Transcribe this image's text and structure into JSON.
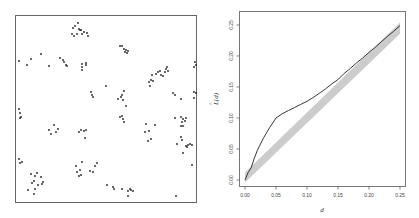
{
  "chart_data": [
    {
      "type": "scatter",
      "title": "",
      "description": "Point pattern in unit square (clustered)",
      "xlabel": "",
      "ylabel": "",
      "axes_visible": false,
      "frame_px": {
        "x0": 15,
        "y0": 15,
        "x1": 196,
        "y1": 202
      },
      "points_px": [
        [
          78,
          23
        ],
        [
          75,
          26
        ],
        [
          73,
          28
        ],
        [
          79,
          29
        ],
        [
          81,
          30
        ],
        [
          84,
          32
        ],
        [
          87,
          33
        ],
        [
          72,
          34
        ],
        [
          77,
          34
        ],
        [
          82,
          34
        ],
        [
          80,
          30
        ],
        [
          88,
          36
        ],
        [
          74,
          36
        ],
        [
          120,
          46
        ],
        [
          122,
          46
        ],
        [
          124,
          49
        ],
        [
          126,
          50
        ],
        [
          125,
          52
        ],
        [
          127,
          53
        ],
        [
          128,
          51
        ],
        [
          19,
          61
        ],
        [
          27,
          65
        ],
        [
          31,
          59
        ],
        [
          41,
          54
        ],
        [
          49,
          66
        ],
        [
          60,
          58
        ],
        [
          63,
          60
        ],
        [
          64,
          62
        ],
        [
          66,
          65
        ],
        [
          67,
          66
        ],
        [
          82,
          64
        ],
        [
          82,
          67
        ],
        [
          86,
          63
        ],
        [
          86,
          65
        ],
        [
          82,
          70
        ],
        [
          149,
          82
        ],
        [
          151,
          80
        ],
        [
          153,
          81
        ],
        [
          150,
          86
        ],
        [
          152,
          75
        ],
        [
          156,
          74
        ],
        [
          158,
          72
        ],
        [
          160,
          71
        ],
        [
          161,
          75
        ],
        [
          163,
          76
        ],
        [
          166,
          69
        ],
        [
          167,
          67
        ],
        [
          168,
          71
        ],
        [
          165,
          72
        ],
        [
          195,
          62
        ],
        [
          194,
          67
        ],
        [
          196,
          65
        ],
        [
          91,
          92
        ],
        [
          92,
          95
        ],
        [
          93,
          97
        ],
        [
          106,
          86
        ],
        [
          118,
          99
        ],
        [
          121,
          97
        ],
        [
          122,
          95
        ],
        [
          124,
          91
        ],
        [
          123,
          100
        ],
        [
          126,
          106
        ],
        [
          120,
          117
        ],
        [
          122,
          116
        ],
        [
          123,
          119
        ],
        [
          124,
          122
        ],
        [
          173,
          93
        ],
        [
          175,
          95
        ],
        [
          181,
          99
        ],
        [
          194,
          92
        ],
        [
          196,
          93
        ],
        [
          194,
          98
        ],
        [
          19,
          109
        ],
        [
          20,
          113
        ],
        [
          21,
          117
        ],
        [
          20,
          118
        ],
        [
          49,
          130
        ],
        [
          51,
          134
        ],
        [
          54,
          125
        ],
        [
          56,
          132
        ],
        [
          58,
          129
        ],
        [
          79,
          132
        ],
        [
          81,
          130
        ],
        [
          84,
          131
        ],
        [
          86,
          130
        ],
        [
          85,
          138
        ],
        [
          145,
          132
        ],
        [
          146,
          124
        ],
        [
          149,
          131
        ],
        [
          151,
          139
        ],
        [
          155,
          125
        ],
        [
          148,
          141
        ],
        [
          175,
          118
        ],
        [
          181,
          117
        ],
        [
          183,
          119
        ],
        [
          185,
          121
        ],
        [
          182,
          122
        ],
        [
          183,
          126
        ],
        [
          186,
          118
        ],
        [
          181,
          126
        ],
        [
          181,
          137
        ],
        [
          182,
          140
        ],
        [
          187,
          147
        ],
        [
          186,
          146
        ],
        [
          188,
          145
        ],
        [
          190,
          144
        ],
        [
          192,
          145
        ],
        [
          177,
          144
        ],
        [
          183,
          153
        ],
        [
          192,
          165
        ],
        [
          19,
          159
        ],
        [
          20,
          163
        ],
        [
          22,
          162
        ],
        [
          31,
          174
        ],
        [
          35,
          176
        ],
        [
          37,
          173
        ],
        [
          41,
          177
        ],
        [
          32,
          183
        ],
        [
          34,
          181
        ],
        [
          38,
          185
        ],
        [
          42,
          184
        ],
        [
          28,
          190
        ],
        [
          35,
          189
        ],
        [
          43,
          182
        ],
        [
          34,
          194
        ],
        [
          76,
          166
        ],
        [
          77,
          172
        ],
        [
          80,
          170
        ],
        [
          82,
          162
        ],
        [
          79,
          176
        ],
        [
          90,
          171
        ],
        [
          93,
          172
        ],
        [
          95,
          166
        ],
        [
          97,
          163
        ],
        [
          81,
          175
        ],
        [
          107,
          185
        ],
        [
          113,
          187
        ],
        [
          114,
          189
        ],
        [
          122,
          189
        ],
        [
          128,
          191
        ],
        [
          130,
          189
        ],
        [
          131,
          190
        ],
        [
          133,
          191
        ],
        [
          128,
          196
        ],
        [
          176,
          196
        ]
      ]
    },
    {
      "type": "line",
      "title": "",
      "xlabel": "d",
      "ylabel": "L̂(d)",
      "xlim": [
        0.0,
        0.25
      ],
      "ylim": [
        0.0,
        0.25
      ],
      "xticks": [
        "0.00",
        "0.05",
        "0.10",
        "0.15",
        "0.20",
        "0.25"
      ],
      "yticks": [
        "0.00",
        "0.05",
        "0.10",
        "0.15",
        "0.20",
        "0.25"
      ],
      "grid": false,
      "legend": null,
      "series": [
        {
          "name": "observed L(d)",
          "color": "#222222",
          "x": [
            0.0,
            0.005,
            0.01,
            0.015,
            0.02,
            0.03,
            0.04,
            0.05,
            0.06,
            0.07,
            0.08,
            0.09,
            0.1,
            0.11,
            0.12,
            0.13,
            0.14,
            0.15,
            0.16,
            0.17,
            0.18,
            0.19,
            0.2,
            0.21,
            0.22,
            0.23,
            0.24,
            0.25
          ],
          "values": [
            0.0,
            0.012,
            0.02,
            0.035,
            0.048,
            0.068,
            0.085,
            0.1,
            0.107,
            0.112,
            0.117,
            0.122,
            0.127,
            0.133,
            0.14,
            0.147,
            0.155,
            0.162,
            0.172,
            0.18,
            0.189,
            0.197,
            0.206,
            0.214,
            0.223,
            0.232,
            0.24,
            0.249
          ]
        },
        {
          "name": "simulation envelope",
          "type": "band",
          "color": "#cccccc",
          "x": [
            0.0,
            0.25
          ],
          "lower": [
            -0.004,
            0.236
          ],
          "upper": [
            0.012,
            0.254
          ]
        }
      ]
    }
  ],
  "right_plot": {
    "xlabel": "d",
    "ylabel_main": "L",
    "ylabel_hat": "^",
    "ylabel_arg": "(d)",
    "xticks": [
      "0.00",
      "0.05",
      "0.10",
      "0.15",
      "0.20",
      "0.25"
    ],
    "yticks": [
      "0.00",
      "0.05",
      "0.10",
      "0.15",
      "0.20",
      "0.25"
    ]
  }
}
